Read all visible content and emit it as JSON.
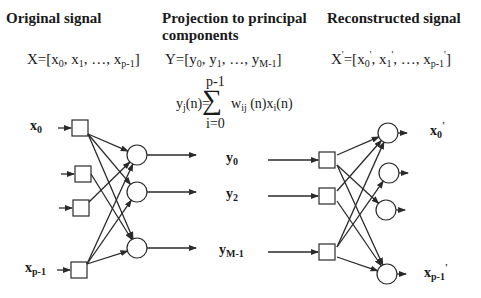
{
  "headers": {
    "original": "Original signal",
    "projection_line1": "Projection to principal",
    "projection_line2": "components",
    "reconstructed": "Reconstructed signal"
  },
  "vectors": {
    "X": {
      "name": "X",
      "open": "=[",
      "items": [
        {
          "base": "x",
          "sub": "0"
        },
        {
          "base": "x",
          "sub": "1"
        },
        {
          "base": "…",
          "sub": ""
        },
        {
          "base": "x",
          "sub": "p-1"
        }
      ],
      "close": "]"
    },
    "Y": {
      "name": "Y",
      "open": "=[",
      "items": [
        {
          "base": "y",
          "sub": "0"
        },
        {
          "base": "y",
          "sub": "1"
        },
        {
          "base": "…",
          "sub": ""
        },
        {
          "base": "y",
          "sub": "M-1"
        }
      ],
      "close": "]"
    },
    "Xp": {
      "name": "X",
      "prime": "'",
      "open": "=[",
      "items": [
        {
          "base": "x",
          "sub": "0",
          "prime": "'"
        },
        {
          "base": "x",
          "sub": "1",
          "prime": "'"
        },
        {
          "base": "…",
          "sub": ""
        },
        {
          "base": "x",
          "sub": "p-1",
          "prime": "'"
        }
      ],
      "close": "]"
    }
  },
  "equation": {
    "upper_limit": "p-1",
    "lhs": "y",
    "lhs_sub": "j",
    "lhs_arg": "(n)=",
    "sigma": "∑",
    "term1": "w",
    "term1_sub": "ij",
    "term1_arg": " (n)x",
    "term2_sub": "i",
    "term2_arg": "(n)",
    "lower_limit": "i=0"
  },
  "left_network": {
    "input_labels": [
      {
        "base": "x",
        "sub": "0"
      },
      {
        "base": "x",
        "sub": "p-1"
      }
    ],
    "output_labels": [
      {
        "base": "y",
        "sub": "0"
      },
      {
        "base": "y",
        "sub": "2"
      },
      {
        "base": "y",
        "sub": "M-1"
      }
    ]
  },
  "right_network": {
    "output_labels": [
      {
        "base": "x",
        "sub": "0",
        "prime": "'"
      },
      {
        "base": "x",
        "sub": "p-1",
        "prime": "'"
      }
    ]
  },
  "colors": {
    "stroke": "#2a2a2a",
    "text": "#1a1a1a",
    "background": "#ffffff"
  }
}
